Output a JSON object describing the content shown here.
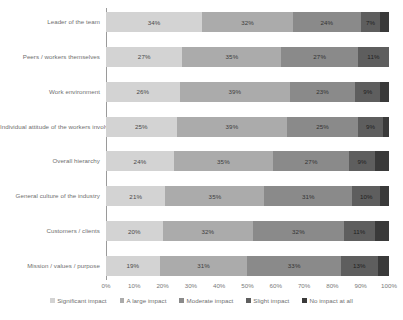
{
  "chart_data": {
    "type": "bar",
    "subtype": "stacked-bar-100-horizontal",
    "orientation": "horizontal",
    "stacked": true,
    "title": "",
    "xlabel": "",
    "ylabel": "",
    "xlim": [
      0,
      100
    ],
    "grid": false,
    "legend_position": "bottom",
    "value_suffix": "%",
    "categories": [
      "Leader of the team",
      "Peers / workers themselves",
      "Work environment",
      "Individual attitude of the workers involved",
      "Overall hierarchy",
      "General culture of the industry",
      "Customers / clients",
      "Mission / values / purpose"
    ],
    "series": [
      {
        "name": "Significant impact",
        "color": "#d3d3d3",
        "label_color": "#4a4a4a",
        "values": [
          34,
          27,
          26,
          25,
          24,
          21,
          20,
          19
        ],
        "labels": [
          "34%",
          "27%",
          "26%",
          "25%",
          "24%",
          "21%",
          "20%",
          "19%"
        ]
      },
      {
        "name": "A large impact",
        "color": "#ababab",
        "label_color": "#3d3d3d",
        "values": [
          32,
          35,
          39,
          39,
          35,
          35,
          32,
          31
        ],
        "labels": [
          "32%",
          "35%",
          "39%",
          "39%",
          "35%",
          "35%",
          "32%",
          "31%"
        ]
      },
      {
        "name": "Moderate impact",
        "color": "#8a8a8a",
        "label_color": "#333333",
        "values": [
          24,
          27,
          23,
          25,
          27,
          31,
          32,
          33
        ],
        "labels": [
          "24%",
          "27%",
          "23%",
          "25%",
          "27%",
          "31%",
          "32%",
          "33%"
        ]
      },
      {
        "name": "Slight impact",
        "color": "#5e5e5e",
        "label_color": "#1f1f1f",
        "values": [
          7,
          11,
          9,
          9,
          9,
          10,
          11,
          13
        ],
        "labels": [
          "7%",
          "11%",
          "9%",
          "9%",
          "9%",
          "10%",
          "11%",
          "13%"
        ]
      },
      {
        "name": "No impact at all",
        "color": "#3a3a3a",
        "label_color": "#ffffff",
        "values": [
          3,
          0,
          3,
          2,
          5,
          3,
          5,
          4
        ],
        "labels": [
          "",
          "",
          "",
          "",
          "",
          "",
          "",
          ""
        ]
      }
    ],
    "xticks": [
      "0%",
      "10%",
      "20%",
      "30%",
      "40%",
      "50%",
      "60%",
      "70%",
      "80%",
      "90%",
      "100%"
    ],
    "xtick_values": [
      0,
      10,
      20,
      30,
      40,
      50,
      60,
      70,
      80,
      90,
      100
    ]
  }
}
